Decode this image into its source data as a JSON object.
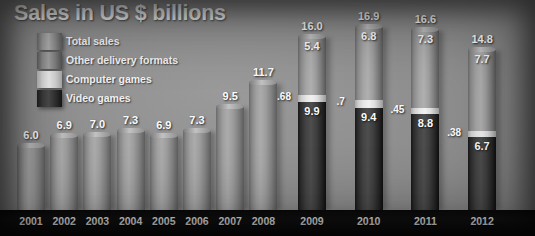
{
  "title": "Sales in US $ billions",
  "legend": {
    "items": [
      {
        "label": "Total sales",
        "swatch": "total-sales-swatch",
        "color": "#a0a0a0"
      },
      {
        "label": "Other delivery formats",
        "swatch": "other-delivery-formats-swatch",
        "color": "#9e9e9e"
      },
      {
        "label": "Computer games",
        "swatch": "computer-games-swatch",
        "color": "#ececec"
      },
      {
        "label": "Video games",
        "swatch": "video-games-swatch",
        "color": "#333333"
      }
    ]
  },
  "chart_data": {
    "type": "bar",
    "title": "Sales in US $ billions",
    "xlabel": "",
    "ylabel": "US $ billions",
    "ylim": [
      0,
      16.9
    ],
    "grid": false,
    "legend_position": "top-left",
    "stacked_from": "2009",
    "categories": [
      "2001",
      "2002",
      "2003",
      "2004",
      "2005",
      "2006",
      "2007",
      "2008",
      "2009",
      "2010",
      "2011",
      "2012"
    ],
    "series": [
      {
        "name": "Total sales",
        "values": [
          6.0,
          6.9,
          7.0,
          7.3,
          6.9,
          7.3,
          9.5,
          11.7,
          16.0,
          16.9,
          16.6,
          14.8
        ]
      },
      {
        "name": "Other delivery formats",
        "values": [
          null,
          null,
          null,
          null,
          null,
          null,
          null,
          null,
          5.4,
          6.8,
          7.3,
          7.7
        ]
      },
      {
        "name": "Computer games",
        "values": [
          null,
          null,
          null,
          null,
          null,
          null,
          null,
          null,
          0.68,
          0.7,
          0.45,
          0.38
        ]
      },
      {
        "name": "Video games",
        "values": [
          null,
          null,
          null,
          null,
          null,
          null,
          null,
          null,
          9.9,
          9.4,
          8.8,
          6.7
        ]
      }
    ],
    "bars": [
      {
        "year": "2001",
        "total": "6.0",
        "stacked": false
      },
      {
        "year": "2002",
        "total": "6.9",
        "stacked": false
      },
      {
        "year": "2003",
        "total": "7.0",
        "stacked": false
      },
      {
        "year": "2004",
        "total": "7.3",
        "stacked": false
      },
      {
        "year": "2005",
        "total": "6.9",
        "stacked": false
      },
      {
        "year": "2006",
        "total": "7.3",
        "stacked": false
      },
      {
        "year": "2007",
        "total": "9.5",
        "stacked": false
      },
      {
        "year": "2008",
        "total": "11.7",
        "stacked": false
      },
      {
        "year": "2009",
        "total": "16.0",
        "other": "5.4",
        "computer": ".68",
        "video": "9.9",
        "stacked": true
      },
      {
        "year": "2010",
        "total": "16.9",
        "other": "6.8",
        "computer": ".7",
        "video": "9.4",
        "stacked": true
      },
      {
        "year": "2011",
        "total": "16.6",
        "other": "7.3",
        "computer": ".45",
        "video": "8.8",
        "stacked": true
      },
      {
        "year": "2012",
        "total": "14.8",
        "other": "7.7",
        "computer": ".38",
        "video": "6.7",
        "stacked": true
      }
    ]
  },
  "axis": {
    "labels": [
      "2001",
      "2002",
      "2003",
      "2004",
      "2005",
      "2006",
      "2007",
      "2008",
      "2009",
      "2010",
      "2011",
      "2012"
    ]
  }
}
